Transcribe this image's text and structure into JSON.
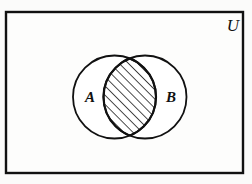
{
  "figure": {
    "kind": "venn-diagram",
    "caption_text": "",
    "universe": {
      "label": "U",
      "shape": "rectangle",
      "x": 6,
      "y": 12,
      "width": 237,
      "height": 161,
      "stroke_color": "#111111",
      "stroke_width": 2.4,
      "fill_color": "#fdfdfc",
      "label_x": 233,
      "label_y": 31
    },
    "sets": [
      {
        "name": "A",
        "label": "A",
        "cx": 114.5,
        "cy": 97,
        "r": 41.5,
        "label_x": 90,
        "label_y": 102,
        "stroke_color": "#111111",
        "stroke_width": 1.8,
        "fill_color": "#ffffff"
      },
      {
        "name": "B",
        "label": "B",
        "cx": 145.0,
        "cy": 97,
        "r": 41.5,
        "label_x": 171,
        "label_y": 102,
        "stroke_color": "#111111",
        "stroke_width": 1.8,
        "fill_color": "#ffffff"
      }
    ],
    "shaded_region": {
      "name": "A-intersect-B",
      "description": "intersection",
      "fill_pattern": "diagonal-hatch",
      "hatch_angle_deg": 45,
      "hatch_spacing_px": 6.5,
      "hatch_stroke_width": 1.5,
      "hatch_color": "#111111",
      "outline_color": "#111111",
      "outline_width": 2.2
    }
  }
}
